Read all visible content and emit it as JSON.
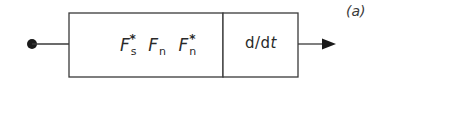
{
  "diagram": {
    "type": "block-diagram",
    "colors": {
      "stroke": "#3a3a3a",
      "fill": "#ffffff",
      "text": "#2a2a2a"
    },
    "input": {
      "symbol": "filled-dot"
    },
    "blocks": [
      {
        "id": "fourier-block",
        "terms": [
          {
            "base": "F",
            "sub": "s",
            "sup": "*"
          },
          {
            "base": "F",
            "sub": "n",
            "sup": ""
          },
          {
            "base": "F",
            "sub": "n",
            "sup": "*"
          }
        ]
      },
      {
        "id": "derivative-block",
        "label_prefix": "d/d",
        "label_var": "t"
      }
    ],
    "output": {
      "symbol": "arrow"
    },
    "caption": "(a)"
  }
}
